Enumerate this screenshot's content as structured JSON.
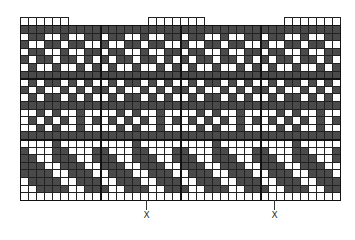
{
  "chart": {
    "cell_size": 8,
    "columns": 40,
    "colors": {
      "dark": "#4a4a4a",
      "light": "#ffffff",
      "grid": "#222222"
    },
    "top_extensions": [
      {
        "start_col": 0,
        "count": 6
      },
      {
        "start_col": 16,
        "count": 7
      },
      {
        "start_col": 33,
        "count": 7
      }
    ],
    "thick_vertical_cols": [
      10,
      20,
      30
    ],
    "thick_horizontal_rows": [
      7,
      15
    ],
    "rows": [
      "1111111111111111111111111111111111111111",
      "0110010011011001001101100100110110010011",
      "1001101100100110110010011011001001101100",
      "0110010011011001001101100100110110010011",
      "1011011010101101101010110110101011011010",
      "0100100101010010010101001001010100100101",
      "1111111111111111111111111111111111111111",
      "0101101010010110101001011010100101101010",
      "1010010101101001010110100101011010010101",
      "0101101010010110101001011010100101101010",
      "1111111111111111111111111111111111111111",
      "0010100100001010010000101001000010100100",
      "0101010101010101010101010101010101010101",
      "0010100100001010010000101001000010100100",
      "1111111111111111111111111111111111111111",
      "0000100000000010000000001000000000100000",
      "1000110001100011000110001100011000110001",
      "1100111001110011100111001110011100111001",
      "1110011100111001110011100111001110011100",
      "1111001110011100111001110011100111001110",
      "0111100111001110011100111001110011100111",
      "0011110011100111001110011100111001110011",
      "0000000000000000000000000000000000000000"
    ]
  },
  "markers": [
    {
      "label": "X",
      "x": 146
    },
    {
      "label": "X",
      "x": 274
    }
  ]
}
